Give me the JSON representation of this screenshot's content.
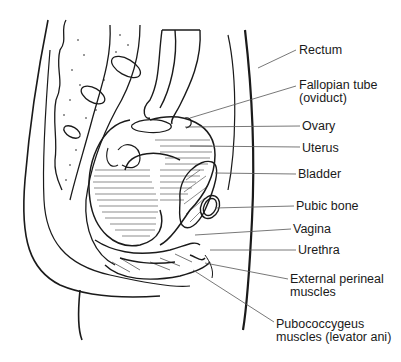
{
  "diagram": {
    "labels": [
      {
        "id": "rectum",
        "lines": [
          "Rectum"
        ],
        "x": 299,
        "y": 44,
        "anchor": [
          258,
          68
        ],
        "end": [
          296,
          50
        ]
      },
      {
        "id": "fallopian-tube",
        "lines": [
          "Fallopian tube",
          "(oviduct)"
        ],
        "x": 299,
        "y": 79,
        "anchor": [
          190,
          118
        ],
        "end": [
          296,
          86
        ]
      },
      {
        "id": "ovary",
        "lines": [
          "Ovary"
        ],
        "x": 302,
        "y": 120,
        "anchor": [
          185,
          127
        ],
        "end": [
          300,
          126
        ]
      },
      {
        "id": "uterus",
        "lines": [
          "Uterus"
        ],
        "x": 302,
        "y": 142,
        "anchor": [
          190,
          146
        ],
        "end": [
          300,
          147
        ]
      },
      {
        "id": "bladder",
        "lines": [
          "Bladder"
        ],
        "x": 298,
        "y": 168,
        "anchor": [
          215,
          173
        ],
        "end": [
          296,
          174
        ]
      },
      {
        "id": "pubic-bone",
        "lines": [
          "Pubic bone"
        ],
        "x": 296,
        "y": 200,
        "anchor": [
          215,
          208
        ],
        "end": [
          294,
          206
        ]
      },
      {
        "id": "vagina",
        "lines": [
          "Vagina"
        ],
        "x": 293,
        "y": 223,
        "anchor": [
          195,
          235
        ],
        "end": [
          291,
          229
        ]
      },
      {
        "id": "urethra",
        "lines": [
          "Urethra"
        ],
        "x": 298,
        "y": 244,
        "anchor": [
          210,
          250
        ],
        "end": [
          296,
          250
        ]
      },
      {
        "id": "external-perineal-muscles",
        "lines": [
          "External perineal",
          "muscles"
        ],
        "x": 290,
        "y": 273,
        "anchor": [
          205,
          263
        ],
        "end": [
          288,
          279
        ]
      },
      {
        "id": "pubococcygeus-muscles",
        "lines": [
          "Pubococcygeus",
          "muscles (levator ani)"
        ],
        "x": 276,
        "y": 318,
        "anchor": [
          193,
          270
        ],
        "end": [
          274,
          322
        ]
      }
    ]
  },
  "colors": {
    "ink": "#1a1a1a",
    "leader": "#555555",
    "background": "#ffffff"
  }
}
